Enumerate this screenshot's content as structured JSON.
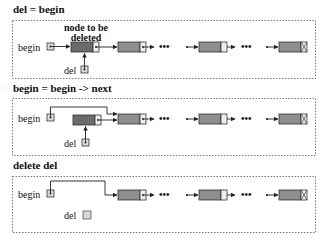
{
  "colors": {
    "deleted_node": "#6b6b6b",
    "node": "#8e8e8e",
    "pointer_cell": "#eeeeee",
    "freed_cell": "#d8d8d8",
    "panel_border": "#777777"
  },
  "panels": [
    {
      "title": "del = begin",
      "begin_label": "begin",
      "del_label": "del",
      "annotation_line1": "node to be",
      "annotation_line2": "deleted"
    },
    {
      "title": "begin = begin -> next",
      "begin_label": "begin",
      "del_label": "del"
    },
    {
      "title": "delete del",
      "begin_label": "begin",
      "del_label": "del"
    }
  ],
  "ellipsis": "•••",
  "null_marker": "X"
}
